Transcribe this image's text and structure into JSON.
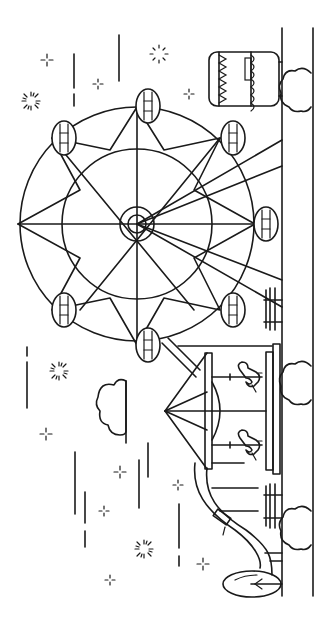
{
  "orientation": "rotated 90 degrees clockwise",
  "colors": {
    "ink": "#1a1a1a",
    "paper": "#ffffff"
  },
  "scene": {
    "elements": [
      {
        "name": "ferris-wheel",
        "gondolas": 8
      },
      {
        "name": "carousel",
        "horses": 2
      },
      {
        "name": "slide"
      },
      {
        "name": "ticket-booth"
      },
      {
        "name": "benches",
        "count": 2
      },
      {
        "name": "tree"
      },
      {
        "name": "clouds",
        "count": 4
      },
      {
        "name": "fireworks",
        "count": 3
      },
      {
        "name": "sparkles",
        "count": 9
      }
    ]
  }
}
